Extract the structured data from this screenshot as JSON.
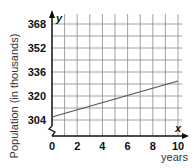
{
  "chart_data": {
    "type": "line",
    "title": "",
    "xlabel": "years",
    "ylabel": "Population (in thousands)",
    "x_axis_var": "x",
    "y_axis_var": "y",
    "x_ticks": [
      0,
      2,
      4,
      6,
      8,
      10
    ],
    "y_ticks": [
      304,
      320,
      336,
      352,
      368
    ],
    "xlim": [
      0,
      10
    ],
    "ylim": [
      300,
      372
    ],
    "grid": true,
    "grid_x_step": 1,
    "grid_y_step": 8,
    "axis_break_on_y": true,
    "series": [
      {
        "name": "population",
        "x": [
          0,
          10
        ],
        "values": [
          306,
          330
        ]
      }
    ],
    "legend": null
  },
  "labels": {
    "ylabel": "Population (in thousands)",
    "xlabel": "years",
    "xvar": "x",
    "yvar": "y",
    "origin": "0"
  },
  "colors": {
    "grid": "#8a8a8a",
    "axis": "#111111",
    "line": "#555555"
  }
}
